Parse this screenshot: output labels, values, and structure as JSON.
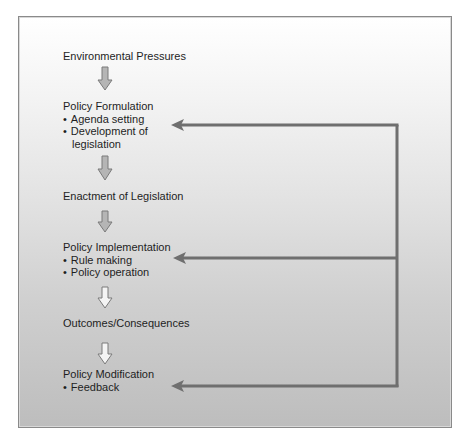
{
  "diagram": {
    "type": "policy process flowchart",
    "stages": [
      {
        "id": "env",
        "title": "Environmental Pressures",
        "bullets": []
      },
      {
        "id": "form",
        "title": "Policy Formulation",
        "bullets": [
          "Agenda setting",
          "Development of",
          "legislation"
        ]
      },
      {
        "id": "enact",
        "title": "Enactment of Legislation",
        "bullets": []
      },
      {
        "id": "impl",
        "title": "Policy Implementation",
        "bullets": [
          "Rule making",
          "Policy operation"
        ]
      },
      {
        "id": "out",
        "title": "Outcomes/Consequences",
        "bullets": []
      },
      {
        "id": "mod",
        "title": "Policy Modification",
        "bullets": [
          "Feedback"
        ]
      }
    ],
    "feedback_loop": {
      "from": "Policy Modification",
      "to": [
        "Policy Formulation",
        "Policy Implementation",
        "Policy Modification"
      ]
    },
    "colors": {
      "arrow": "#6f6f6f",
      "frame_border": "#8a8a8a",
      "gradient_top": "#ffffff",
      "gradient_bottom": "#bdbdbd"
    }
  }
}
